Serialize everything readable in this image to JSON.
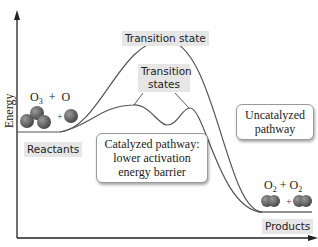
{
  "diagram": {
    "type": "reaction-energy-profile",
    "axes": {
      "y_label": "Energy",
      "x_label": ""
    },
    "labels": {
      "transition_state": "Transition state",
      "transition_states": "Transition states",
      "reactants": "Reactants",
      "products": "Products"
    },
    "callouts": {
      "uncatalyzed": "Uncatalyzed pathway",
      "catalyzed": "Catalyzed pathway: lower activation energy barrier"
    },
    "reactants_formula": {
      "a": "O",
      "a_sub": "3",
      "plus": "+",
      "b": "O"
    },
    "products_formula": {
      "a": "O",
      "a_sub": "2",
      "plus": "+",
      "b": "O",
      "b_sub": "2"
    },
    "colors": {
      "curve": "#555555",
      "axis": "#222222",
      "molecule": "#6b6b6b",
      "label_bg": "#e6e6e6"
    }
  }
}
